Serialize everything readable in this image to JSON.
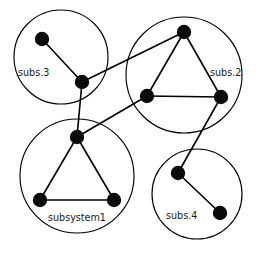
{
  "diagram": {
    "type": "node-link-graph",
    "title": "",
    "canvas": {
      "width": 259,
      "height": 257
    },
    "style": {
      "background_color": "#ffffff",
      "node_color": "#0a0a0a",
      "edge_color": "#000000",
      "boundary_color": "#000000",
      "label_color": "#1a1a1a",
      "node_radius": 7.2,
      "edge_width": 1.6,
      "boundary_width": 1.15,
      "label_font_size": 9.6
    },
    "subsystems": [
      {
        "id": "subs3",
        "label": "subs.3",
        "label_x": 18,
        "label_y": 76,
        "boundary": {
          "cx": 61,
          "cy": 57,
          "r": 47
        }
      },
      {
        "id": "subs2",
        "label": "subs.2",
        "label_x": 210,
        "label_y": 76,
        "boundary": {
          "cx": 184,
          "cy": 75,
          "r": 58
        }
      },
      {
        "id": "subsystem1",
        "label": "subsystem1",
        "label_x": 48,
        "label_y": 221,
        "boundary": {
          "cx": 77,
          "cy": 176,
          "r": 57
        }
      },
      {
        "id": "subs4",
        "label": "subs.4",
        "label_x": 166,
        "label_y": 219,
        "boundary": {
          "cx": 197,
          "cy": 194,
          "r": 45
        }
      }
    ],
    "nodes": [
      {
        "id": "n1",
        "subsystem": "subs3",
        "x": 42,
        "y": 39
      },
      {
        "id": "n2",
        "subsystem": "subs3",
        "x": 82,
        "y": 82
      },
      {
        "id": "n3",
        "subsystem": "subs2",
        "x": 184,
        "y": 32
      },
      {
        "id": "n4",
        "subsystem": "subs2",
        "x": 147,
        "y": 96
      },
      {
        "id": "n5",
        "subsystem": "subs2",
        "x": 221,
        "y": 97
      },
      {
        "id": "n6",
        "subsystem": "subsystem1",
        "x": 77,
        "y": 137
      },
      {
        "id": "n7",
        "subsystem": "subsystem1",
        "x": 40,
        "y": 200
      },
      {
        "id": "n8",
        "subsystem": "subsystem1",
        "x": 114,
        "y": 200
      },
      {
        "id": "n9",
        "subsystem": "subs4",
        "x": 178,
        "y": 173
      },
      {
        "id": "n10",
        "subsystem": "subs4",
        "x": 220,
        "y": 213
      }
    ],
    "edges": [
      {
        "id": "e1",
        "from": "n1",
        "to": "n2",
        "kind": "intra"
      },
      {
        "id": "e2",
        "from": "n3",
        "to": "n4",
        "kind": "intra"
      },
      {
        "id": "e3",
        "from": "n3",
        "to": "n5",
        "kind": "intra"
      },
      {
        "id": "e4",
        "from": "n4",
        "to": "n5",
        "kind": "intra"
      },
      {
        "id": "e5",
        "from": "n6",
        "to": "n7",
        "kind": "intra"
      },
      {
        "id": "e6",
        "from": "n6",
        "to": "n8",
        "kind": "intra"
      },
      {
        "id": "e7",
        "from": "n7",
        "to": "n8",
        "kind": "intra"
      },
      {
        "id": "e8",
        "from": "n9",
        "to": "n10",
        "kind": "intra"
      },
      {
        "id": "e9",
        "from": "n2",
        "to": "n3",
        "kind": "inter"
      },
      {
        "id": "e10",
        "from": "n2",
        "to": "n6",
        "kind": "inter"
      },
      {
        "id": "e11",
        "from": "n6",
        "to": "n4",
        "kind": "inter"
      },
      {
        "id": "e12",
        "from": "n5",
        "to": "n9",
        "kind": "inter"
      }
    ]
  }
}
